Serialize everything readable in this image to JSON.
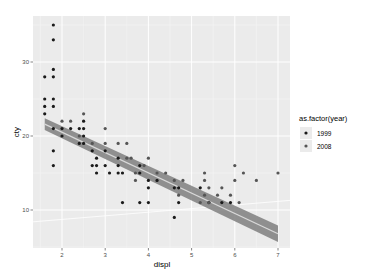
{
  "chart_data": {
    "type": "scatter",
    "title": "",
    "xlabel": "displ",
    "ylabel": "cty",
    "xlim": [
      1.33,
      7.28
    ],
    "ylim": [
      4.9,
      36.3
    ],
    "x_ticks": [
      2,
      3,
      4,
      5,
      6,
      7
    ],
    "y_ticks": [
      10,
      20,
      30
    ],
    "grid": true,
    "legend": {
      "title": "as.factor(year)",
      "position": "right",
      "entries": [
        {
          "label": "1999",
          "color": "#1a1a1a"
        },
        {
          "label": "2008",
          "color": "#555555"
        }
      ]
    },
    "series": [
      {
        "name": "1999",
        "color": "#1a1a1a",
        "points": [
          [
            1.8,
            35
          ],
          [
            1.8,
            33
          ],
          [
            1.8,
            29
          ],
          [
            1.6,
            28
          ],
          [
            1.8,
            28
          ],
          [
            1.6,
            25
          ],
          [
            1.8,
            25
          ],
          [
            1.6,
            24
          ],
          [
            1.8,
            24
          ],
          [
            1.6,
            23
          ],
          [
            2.0,
            21
          ],
          [
            1.8,
            21
          ],
          [
            2.2,
            21
          ],
          [
            2.4,
            21
          ],
          [
            2.5,
            21
          ],
          [
            2.5,
            22
          ],
          [
            2.0,
            20
          ],
          [
            2.4,
            19
          ],
          [
            2.5,
            19
          ],
          [
            2.5,
            20
          ],
          [
            1.8,
            18
          ],
          [
            1.8,
            16
          ],
          [
            2.7,
            18
          ],
          [
            2.8,
            17
          ],
          [
            2.8,
            16
          ],
          [
            2.8,
            15
          ],
          [
            2.7,
            16
          ],
          [
            3.0,
            18
          ],
          [
            3.0,
            16
          ],
          [
            3.3,
            17
          ],
          [
            3.3,
            16
          ],
          [
            3.3,
            15
          ],
          [
            3.1,
            15
          ],
          [
            3.4,
            15
          ],
          [
            3.8,
            16
          ],
          [
            3.8,
            15
          ],
          [
            4.0,
            14
          ],
          [
            4.0,
            13
          ],
          [
            4.2,
            14
          ],
          [
            4.6,
            13
          ],
          [
            4.7,
            13
          ],
          [
            4.7,
            11
          ],
          [
            4.6,
            9
          ],
          [
            4.0,
            11
          ],
          [
            3.8,
            11
          ],
          [
            3.4,
            11
          ],
          [
            5.2,
            13
          ],
          [
            5.4,
            11
          ],
          [
            5.7,
            11
          ],
          [
            5.9,
            11
          ]
        ]
      },
      {
        "name": "2008",
        "color": "#555555",
        "points": [
          [
            2.0,
            22
          ],
          [
            2.2,
            22
          ],
          [
            2.4,
            20
          ],
          [
            2.5,
            23
          ],
          [
            2.7,
            19
          ],
          [
            3.0,
            19
          ],
          [
            3.0,
            21
          ],
          [
            3.3,
            19
          ],
          [
            3.5,
            19
          ],
          [
            3.5,
            17
          ],
          [
            3.6,
            17
          ],
          [
            3.7,
            15
          ],
          [
            3.7,
            14
          ],
          [
            3.9,
            16
          ],
          [
            4.0,
            17
          ],
          [
            4.2,
            15
          ],
          [
            4.4,
            15
          ],
          [
            4.6,
            14
          ],
          [
            4.7,
            12
          ],
          [
            4.8,
            14
          ],
          [
            5.3,
            14
          ],
          [
            5.3,
            15
          ],
          [
            5.3,
            12
          ],
          [
            5.4,
            13
          ],
          [
            5.6,
            12
          ],
          [
            5.7,
            13
          ],
          [
            6.0,
            16
          ],
          [
            6.0,
            14
          ],
          [
            6.1,
            11
          ],
          [
            6.2,
            15
          ],
          [
            6.5,
            14
          ],
          [
            7.0,
            15
          ],
          [
            5.9,
            12
          ],
          [
            5.4,
            11
          ],
          [
            5.2,
            11
          ]
        ]
      }
    ],
    "smooth": {
      "method": "lm",
      "line": [
        [
          1.6,
          21.6
        ],
        [
          7.0,
          6.8
        ]
      ],
      "band_halfwidth": 0.8,
      "band_color": "#7f7f7f",
      "line_color": "#5a5a5a"
    },
    "reference_line": {
      "color": "#ffffff",
      "line": [
        [
          1.33,
          8.4
        ],
        [
          7.28,
          11.3
        ]
      ]
    }
  },
  "axis": {
    "x_title": "displ",
    "y_title": "cty"
  },
  "legend": {
    "title": "as.factor(year)",
    "items": [
      {
        "label": "1999"
      },
      {
        "label": "2008"
      }
    ]
  },
  "colors": {
    "panel_bg": "#ebebeb",
    "grid_major": "#ffffff",
    "grid_minor": "#f5f5f5"
  }
}
